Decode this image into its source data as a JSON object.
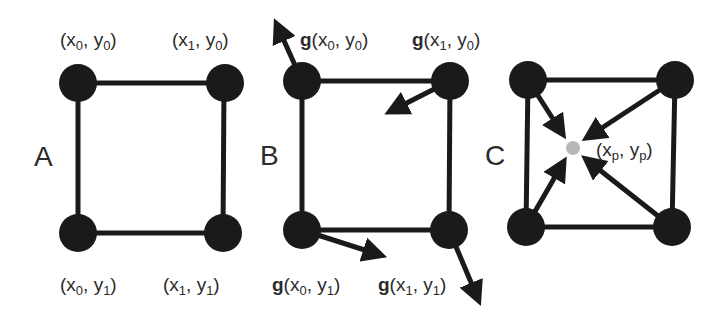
{
  "colors": {
    "node": "#1a1a1a",
    "edge": "#1a1a1a",
    "text": "#2b2b2b",
    "interp_point": "#b8b8b8",
    "background": "#ffffff"
  },
  "panels": [
    {
      "id": "A",
      "label": "A",
      "nodes": [
        {
          "cx": 78,
          "cy": 83,
          "label": {
            "prefix": "",
            "x_sub": "0",
            "y_sub": "0"
          }
        },
        {
          "cx": 225,
          "cy": 83,
          "label": {
            "prefix": "",
            "x_sub": "1",
            "y_sub": "0"
          }
        },
        {
          "cx": 78,
          "cy": 233,
          "label": {
            "prefix": "",
            "x_sub": "0",
            "y_sub": "1"
          }
        },
        {
          "cx": 223,
          "cy": 233,
          "label": {
            "prefix": "",
            "x_sub": "1",
            "y_sub": "1"
          }
        }
      ],
      "labels": {
        "top_left": "(x0, y0)",
        "top_right": "(x1, y0)",
        "bottom_left": "(x0, y1)",
        "bottom_right": "(x1, y1)"
      }
    },
    {
      "id": "B",
      "label": "B",
      "labels": {
        "top_left": "g(x0, y0)",
        "top_right": "g(x1, y0)",
        "bottom_left": "g(x0, y1)",
        "bottom_right": "g(x1, y1)"
      },
      "gradient_arrows": [
        {
          "from": [
            302,
            81
          ],
          "to": [
            272,
            14
          ]
        },
        {
          "from": [
            450,
            81
          ],
          "to": [
            380,
            117
          ]
        },
        {
          "from": [
            302,
            230
          ],
          "to": [
            392,
            259
          ]
        },
        {
          "from": [
            449,
            230
          ],
          "to": [
            483,
            310
          ]
        }
      ]
    },
    {
      "id": "C",
      "label": "C",
      "labels": {
        "point": "(xp, yp)"
      },
      "interp_point": {
        "cx": 573,
        "cy": 148
      }
    }
  ],
  "text": {
    "panel_a": "A",
    "panel_b": "B",
    "panel_c": "C",
    "g": "g",
    "open": "(",
    "close": ")",
    "x": "x",
    "y": "y",
    "comma": ", ",
    "sub0": "0",
    "sub1": "1",
    "subp": "p"
  }
}
